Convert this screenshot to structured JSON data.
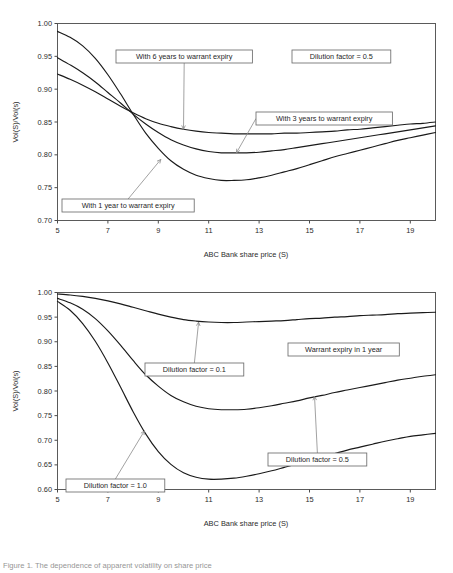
{
  "figure": {
    "caption": "Figure 1. The dependence of apparent volatility on share price"
  },
  "chart_data": [
    {
      "id": "top",
      "type": "line",
      "title": "",
      "xlabel": "ABC Bank share price (S)",
      "ylabel": "Vol(S)/Vol(s)",
      "xlim": [
        5,
        20
      ],
      "ylim": [
        0.7,
        1.0
      ],
      "xticks": [
        5,
        7,
        9,
        11,
        13,
        15,
        17,
        19
      ],
      "yticks": [
        0.7,
        0.75,
        0.8,
        0.85,
        0.9,
        0.95,
        1.0
      ],
      "ytick_labels": [
        "0.70",
        "0.75",
        "0.80",
        "0.85",
        "0.90",
        "0.95",
        "1.00"
      ],
      "xtick_labels": [
        "5",
        "7",
        "9",
        "11",
        "13",
        "15",
        "17",
        "19"
      ],
      "grid": false,
      "legend_position": "inline-annotations",
      "x": [
        5,
        5.5,
        6,
        6.5,
        7,
        7.5,
        8,
        8.5,
        9,
        9.5,
        10,
        10.5,
        11,
        11.5,
        12,
        12.5,
        13,
        13.5,
        14,
        14.5,
        15,
        15.5,
        16,
        16.5,
        17,
        17.5,
        18,
        18.5,
        19,
        19.5,
        20
      ],
      "series": [
        {
          "name": "With 1 year to warrant expiry",
          "values": [
            0.988,
            0.979,
            0.966,
            0.947,
            0.922,
            0.893,
            0.862,
            0.833,
            0.81,
            0.791,
            0.778,
            0.769,
            0.764,
            0.761,
            0.761,
            0.762,
            0.765,
            0.769,
            0.774,
            0.779,
            0.785,
            0.791,
            0.797,
            0.802,
            0.807,
            0.812,
            0.817,
            0.822,
            0.826,
            0.83,
            0.834
          ]
        },
        {
          "name": "With 3 years to warrant expiry",
          "values": [
            0.948,
            0.937,
            0.925,
            0.911,
            0.895,
            0.879,
            0.862,
            0.847,
            0.834,
            0.823,
            0.815,
            0.809,
            0.805,
            0.803,
            0.803,
            0.803,
            0.804,
            0.806,
            0.808,
            0.811,
            0.814,
            0.817,
            0.82,
            0.823,
            0.826,
            0.829,
            0.832,
            0.835,
            0.838,
            0.841,
            0.844
          ]
        },
        {
          "name": "With 6 years to warrant expiry",
          "values": [
            0.923,
            0.915,
            0.906,
            0.896,
            0.885,
            0.874,
            0.864,
            0.855,
            0.848,
            0.843,
            0.839,
            0.836,
            0.834,
            0.833,
            0.832,
            0.832,
            0.832,
            0.832,
            0.833,
            0.833,
            0.834,
            0.835,
            0.836,
            0.838,
            0.839,
            0.841,
            0.843,
            0.845,
            0.847,
            0.848,
            0.85
          ]
        }
      ],
      "annotations": [
        {
          "text": "With 6 years to warrant expiry",
          "box_x": 116,
          "box_y": 50,
          "arrow_to_x": 10.0,
          "arrow_to_y": 0.839
        },
        {
          "text": "Dilution factor = 0.5",
          "box_x": 292,
          "box_y": 50,
          "arrow_to_x": null,
          "arrow_to_y": null
        },
        {
          "text": "With 3 years to warrant expiry",
          "box_x": 256,
          "box_y": 112,
          "arrow_to_x": 12.1,
          "arrow_to_y": 0.803
        },
        {
          "text": "With 1 year to warrant expiry",
          "box_x": 62,
          "box_y": 199,
          "arrow_to_x": 9.1,
          "arrow_to_y": 0.793
        }
      ]
    },
    {
      "id": "bottom",
      "type": "line",
      "title": "",
      "xlabel": "ABC Bank share price (S)",
      "ylabel": "Vol(S)/Vol(s)",
      "xlim": [
        5,
        20
      ],
      "ylim": [
        0.6,
        1.0
      ],
      "xticks": [
        5,
        7,
        9,
        11,
        13,
        15,
        17,
        19
      ],
      "yticks": [
        0.6,
        0.65,
        0.7,
        0.75,
        0.8,
        0.85,
        0.9,
        0.95,
        1.0
      ],
      "ytick_labels": [
        "0.60",
        "0.65",
        "0.70",
        "0.75",
        "0.80",
        "0.85",
        "0.90",
        "0.95",
        "1.00"
      ],
      "xtick_labels": [
        "5",
        "7",
        "9",
        "11",
        "13",
        "15",
        "17",
        "19"
      ],
      "grid": false,
      "legend_position": "inline-annotations",
      "x": [
        5,
        5.5,
        6,
        6.5,
        7,
        7.5,
        8,
        8.5,
        9,
        9.5,
        10,
        10.5,
        11,
        11.5,
        12,
        12.5,
        13,
        13.5,
        14,
        14.5,
        15,
        15.5,
        16,
        16.5,
        17,
        17.5,
        18,
        18.5,
        19,
        19.5,
        20
      ],
      "series": [
        {
          "name": "Dilution factor = 0.1",
          "values": [
            0.997,
            0.995,
            0.992,
            0.988,
            0.983,
            0.977,
            0.97,
            0.963,
            0.956,
            0.95,
            0.945,
            0.942,
            0.94,
            0.939,
            0.939,
            0.94,
            0.941,
            0.942,
            0.943,
            0.945,
            0.947,
            0.948,
            0.95,
            0.951,
            0.953,
            0.954,
            0.955,
            0.957,
            0.958,
            0.959,
            0.96
          ]
        },
        {
          "name": "Dilution factor = 0.5",
          "values": [
            0.988,
            0.979,
            0.966,
            0.947,
            0.922,
            0.893,
            0.862,
            0.833,
            0.81,
            0.791,
            0.778,
            0.769,
            0.764,
            0.762,
            0.762,
            0.763,
            0.766,
            0.77,
            0.775,
            0.78,
            0.786,
            0.791,
            0.797,
            0.802,
            0.807,
            0.812,
            0.817,
            0.822,
            0.826,
            0.83,
            0.833
          ]
        },
        {
          "name": "Dilution factor = 1.0",
          "values": [
            0.982,
            0.964,
            0.937,
            0.901,
            0.857,
            0.808,
            0.758,
            0.713,
            0.677,
            0.651,
            0.634,
            0.625,
            0.621,
            0.621,
            0.623,
            0.627,
            0.632,
            0.638,
            0.645,
            0.652,
            0.659,
            0.666,
            0.673,
            0.68,
            0.686,
            0.692,
            0.698,
            0.703,
            0.708,
            0.711,
            0.714
          ]
        }
      ],
      "annotations": [
        {
          "text": "Dilution factor = 0.1",
          "box_x": 145,
          "box_y": 363,
          "arrow_to_x": 10.6,
          "arrow_to_y": 0.94
        },
        {
          "text": "Warrant expiry in 1 year",
          "box_x": 288,
          "box_y": 343,
          "arrow_to_x": null,
          "arrow_to_y": null
        },
        {
          "text": "Dilution factor = 0.5",
          "box_x": 268,
          "box_y": 453,
          "arrow_to_x": 15.2,
          "arrow_to_y": 0.789
        },
        {
          "text": "Dilution factor = 1.0",
          "box_x": 66,
          "box_y": 479,
          "arrow_to_x": 8.45,
          "arrow_to_y": 0.719
        }
      ]
    }
  ]
}
